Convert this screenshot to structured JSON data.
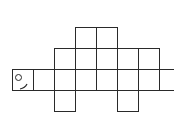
{
  "diagram": {
    "type": "grid-net",
    "cell_size": 21,
    "origin": {
      "x": 12,
      "y": 27
    },
    "line_color": "#2a2a2a",
    "background": "#ffffff",
    "cells": [
      {
        "row": 0,
        "col": 3
      },
      {
        "row": 0,
        "col": 4
      },
      {
        "row": 1,
        "col": 2
      },
      {
        "row": 1,
        "col": 3
      },
      {
        "row": 1,
        "col": 4
      },
      {
        "row": 1,
        "col": 5
      },
      {
        "row": 1,
        "col": 6
      },
      {
        "row": 2,
        "col": 0,
        "head": true
      },
      {
        "row": 2,
        "col": 1
      },
      {
        "row": 2,
        "col": 2
      },
      {
        "row": 2,
        "col": 3
      },
      {
        "row": 2,
        "col": 4
      },
      {
        "row": 2,
        "col": 5
      },
      {
        "row": 2,
        "col": 6
      },
      {
        "row": 2,
        "col": 7
      },
      {
        "row": 3,
        "col": 2
      },
      {
        "row": 3,
        "col": 5
      }
    ],
    "head": {
      "eye": {
        "shape": "circle",
        "cx": 5,
        "cy": 7,
        "r": 3.5
      },
      "mouth": {
        "shape": "curve"
      }
    }
  }
}
